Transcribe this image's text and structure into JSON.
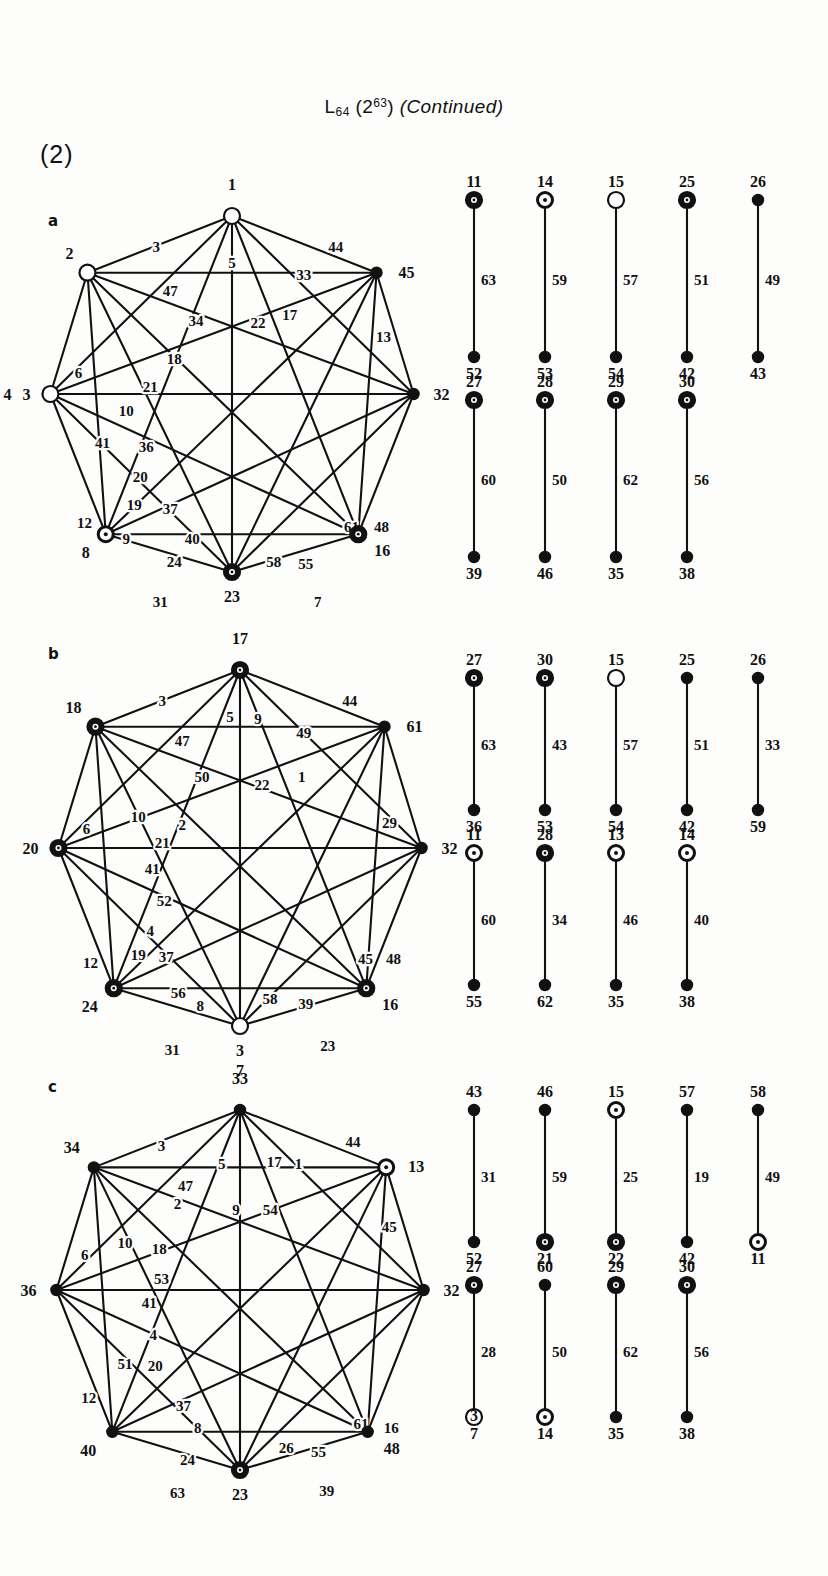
{
  "page": {
    "title_base": "L",
    "title_sub": "64",
    "title_paren_open": "(2",
    "title_sup": "63",
    "title_paren_close": ")",
    "title_continued": "(Continued)",
    "section_number": "(2)",
    "ink_color": "#111111",
    "paper_color": "#fdfdfb"
  },
  "panels": [
    {
      "letter": "a",
      "polygon": {
        "nodes": [
          {
            "label": "1",
            "style": "open",
            "pos": "top"
          },
          {
            "label": "45",
            "style": "solid",
            "pos": "top-right"
          },
          {
            "label": "32",
            "style": "solid",
            "pos": "right"
          },
          {
            "label": "16",
            "style": "dotring",
            "pos": "bottom-right"
          },
          {
            "label": "23",
            "style": "dotring",
            "pos": "bottom"
          },
          {
            "label": "8",
            "style": "ring",
            "pos": "bottom-left"
          },
          {
            "label": "3",
            "style": "open",
            "pos": "left",
            "alt_label": "4"
          },
          {
            "label": "2",
            "style": "open",
            "pos": "top-left"
          }
        ],
        "edge_labels": [
          "3",
          "5",
          "44",
          "33",
          "47",
          "34",
          "22",
          "17",
          "13",
          "6",
          "18",
          "21",
          "10",
          "41",
          "36",
          "20",
          "19",
          "12",
          "37",
          "9",
          "40",
          "24",
          "58",
          "55",
          "61",
          "48",
          "31",
          "7"
        ]
      },
      "segment_rows": [
        {
          "top": [
            "11",
            "14",
            "15",
            "25",
            "26"
          ],
          "mid": [
            "63",
            "59",
            "57",
            "51",
            "49"
          ],
          "bottom": [
            "52",
            "53",
            "54",
            "42",
            "43"
          ],
          "top_styles": [
            "dotring",
            "ring",
            "open",
            "dotring",
            "solid"
          ],
          "bottom_styles": [
            "solid",
            "solid",
            "solid",
            "solid",
            "solid"
          ]
        },
        {
          "top": [
            "27",
            "28",
            "29",
            "30"
          ],
          "mid": [
            "60",
            "50",
            "62",
            "56"
          ],
          "bottom": [
            "39",
            "46",
            "35",
            "38"
          ],
          "top_styles": [
            "dotring",
            "dotring",
            "dotring",
            "dotring"
          ],
          "bottom_styles": [
            "solid",
            "solid",
            "solid",
            "solid"
          ]
        }
      ]
    },
    {
      "letter": "b",
      "polygon": {
        "nodes": [
          {
            "label": "17",
            "style": "dotring",
            "pos": "top"
          },
          {
            "label": "61",
            "style": "solid",
            "pos": "top-right"
          },
          {
            "label": "32",
            "style": "solid",
            "pos": "right"
          },
          {
            "label": "16",
            "style": "dotring",
            "pos": "bottom-right"
          },
          {
            "label": "3",
            "style": "open",
            "pos": "bottom",
            "alt_label": "7"
          },
          {
            "label": "24",
            "style": "dotring",
            "pos": "bottom-left"
          },
          {
            "label": "20",
            "style": "dotring",
            "pos": "left"
          },
          {
            "label": "18",
            "style": "dotring",
            "pos": "top-left"
          }
        ],
        "edge_labels": [
          "3",
          "5",
          "9",
          "44",
          "47",
          "49",
          "50",
          "22",
          "1",
          "29",
          "6",
          "10",
          "2",
          "21",
          "41",
          "52",
          "4",
          "12",
          "19",
          "37",
          "56",
          "8",
          "58",
          "39",
          "45",
          "48",
          "31",
          "23"
        ]
      },
      "segment_rows": [
        {
          "top": [
            "27",
            "30",
            "15",
            "25",
            "26"
          ],
          "mid": [
            "63",
            "43",
            "57",
            "51",
            "33"
          ],
          "bottom": [
            "36",
            "53",
            "54",
            "42",
            "59"
          ],
          "top_styles": [
            "dotring",
            "dotring",
            "open",
            "solid",
            "solid"
          ],
          "bottom_styles": [
            "solid",
            "solid",
            "solid",
            "solid",
            "solid"
          ]
        },
        {
          "top": [
            "11",
            "28",
            "13",
            "14"
          ],
          "mid": [
            "60",
            "34",
            "46",
            "40"
          ],
          "bottom": [
            "55",
            "62",
            "35",
            "38"
          ],
          "top_styles": [
            "ring",
            "dotring",
            "ring",
            "ring"
          ],
          "bottom_styles": [
            "solid",
            "solid",
            "solid",
            "solid"
          ]
        }
      ]
    },
    {
      "letter": "c",
      "polygon": {
        "nodes": [
          {
            "label": "33",
            "style": "solid",
            "pos": "top"
          },
          {
            "label": "13",
            "style": "ring",
            "pos": "top-right"
          },
          {
            "label": "32",
            "style": "solid",
            "pos": "right"
          },
          {
            "label": "48",
            "style": "solid",
            "pos": "bottom-right"
          },
          {
            "label": "23",
            "style": "dotring",
            "pos": "bottom"
          },
          {
            "label": "40",
            "style": "solid",
            "pos": "bottom-left"
          },
          {
            "label": "36",
            "style": "solid",
            "pos": "left"
          },
          {
            "label": "34",
            "style": "solid",
            "pos": "top-left"
          }
        ],
        "edge_labels": [
          "3",
          "5",
          "17",
          "1",
          "44",
          "47",
          "2",
          "9",
          "54",
          "45",
          "6",
          "10",
          "18",
          "53",
          "41",
          "4",
          "51",
          "20",
          "12",
          "37",
          "8",
          "24",
          "26",
          "55",
          "61",
          "16",
          "63",
          "39"
        ]
      },
      "segment_rows": [
        {
          "top": [
            "43",
            "46",
            "15",
            "57",
            "58"
          ],
          "mid": [
            "31",
            "59",
            "25",
            "19",
            "49"
          ],
          "bottom": [
            "52",
            "21",
            "22",
            "42",
            "11"
          ],
          "top_styles": [
            "solid",
            "solid",
            "ring",
            "solid",
            "solid"
          ],
          "bottom_styles": [
            "solid",
            "dotring",
            "dotring",
            "solid",
            "ring"
          ]
        },
        {
          "top": [
            "27",
            "60",
            "29",
            "30"
          ],
          "mid": [
            "28",
            "50",
            "62",
            "56"
          ],
          "bottom": [
            "3",
            "14",
            "35",
            "38"
          ],
          "bottom_alt": [
            "7",
            "",
            "",
            ""
          ],
          "top_styles": [
            "dotring",
            "solid",
            "dotring",
            "dotring"
          ],
          "bottom_styles": [
            "open",
            "ring",
            "solid",
            "solid"
          ]
        }
      ]
    }
  ]
}
